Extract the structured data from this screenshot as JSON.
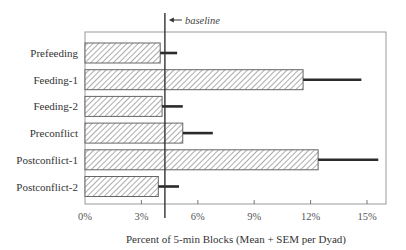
{
  "chart_data": {
    "type": "bar",
    "orientation": "horizontal",
    "title": "",
    "xlabel": "Percent of 5-min Blocks (Mean + SEM per Dyad)",
    "ylabel": "",
    "categories": [
      "Prefeeding",
      "Feeding-1",
      "Feeding-2",
      "Preconflict",
      "Postconflict-1",
      "Postconflict-2"
    ],
    "series": [
      {
        "name": "Mean",
        "values": [
          4.0,
          11.6,
          4.1,
          5.2,
          12.4,
          3.9
        ],
        "sem": [
          0.9,
          3.1,
          1.1,
          1.6,
          3.2,
          1.1
        ],
        "pattern": "diagonal-hatch"
      }
    ],
    "xlim": [
      0,
      16
    ],
    "xticks": [
      0,
      3,
      6,
      9,
      12,
      15
    ],
    "xtick_labels": [
      "0%",
      "3%",
      "6%",
      "9%",
      "12%",
      "15%"
    ],
    "reference_line": {
      "value": 4.25,
      "label": "baseline",
      "arrow": "←"
    },
    "grid": false,
    "legend": null
  },
  "colors": {
    "bar_fill": "#ffffff",
    "hatch": "#555555",
    "bar_border": "#666666",
    "error_bar": "#2b2b2b",
    "frame": "#999999",
    "baseline": "#333333"
  }
}
